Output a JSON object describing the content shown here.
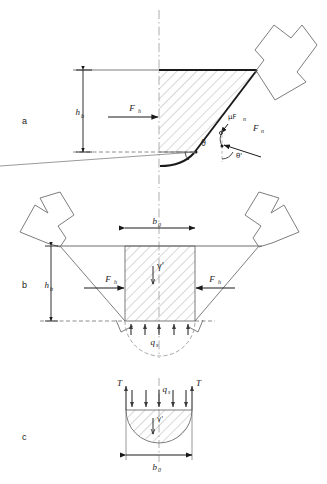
{
  "figure": {
    "type": "engineering-diagram",
    "title": "",
    "panels": [
      {
        "id": "a",
        "letter": "a",
        "description": "Grab bucket closing - single shell with soil wedge, force equilibrium",
        "labels": {
          "height": "h",
          "height_sub": "b",
          "horizontal_force": "F",
          "horizontal_force_sub": "h",
          "normal_force": "F",
          "normal_force_sub": "n",
          "friction_force": "μF",
          "friction_force_sub": "n",
          "angle_theta": "θ",
          "angle_theta_prime": "θ'"
        }
      },
      {
        "id": "b",
        "letter": "b",
        "description": "Full grab bucket cross-section with soil column and base reaction",
        "labels": {
          "height": "h",
          "height_sub": "b",
          "width": "b",
          "width_sub": "0",
          "horizontal_force_left": "F",
          "horizontal_force_left_sub": "h",
          "horizontal_force_right": "F",
          "horizontal_force_right_sub": "h",
          "unit_weight": "γ'",
          "base_pressure": "q",
          "base_pressure_sub": "s"
        }
      },
      {
        "id": "c",
        "letter": "c",
        "description": "Soil plug free body - semicircular bulb with surcharge, shear and width",
        "labels": {
          "shear_left": "T",
          "shear_right": "T",
          "surcharge": "q",
          "surcharge_sub": "s",
          "unit_weight": "γ'",
          "width": "b",
          "width_sub": "0"
        }
      }
    ],
    "colors": {
      "line": "#1a1a1a",
      "thin_line": "#6e6e6e",
      "hatch": "#9a9a9a",
      "dash": "#9a9a9a",
      "background": "#ffffff"
    }
  }
}
